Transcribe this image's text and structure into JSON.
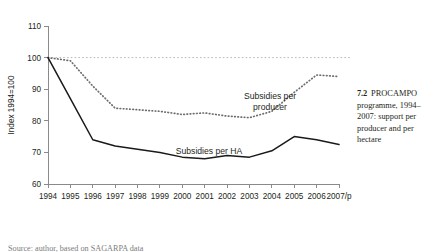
{
  "caption": {
    "number": "7.2",
    "text": "PROCAMPO programme, 1994–2007: support per producer and per hectare"
  },
  "footer": {
    "partial_text": "Source: author, based on SAGARPA data"
  },
  "chart_data": {
    "type": "line",
    "title": "",
    "subtitle": "",
    "xlabel": "",
    "ylabel": "Index 1994=100",
    "ylim": [
      60,
      110
    ],
    "yticks": [
      60,
      70,
      80,
      90,
      100,
      110
    ],
    "grid": false,
    "legend_position": "inline-annotation",
    "reference_line": {
      "value": 100,
      "style": "dotted",
      "color": "#b9b9b9"
    },
    "categories": [
      "1994",
      "1995",
      "1996",
      "1997",
      "1998",
      "1999",
      "2000",
      "2001",
      "2002",
      "2003",
      "2004",
      "2005",
      "2006",
      "2007/p"
    ],
    "series": [
      {
        "name": "Subsidies per producer",
        "style": "dotted",
        "color": "#6d6d6d",
        "values": [
          100,
          99,
          91,
          84,
          83.5,
          83,
          82,
          82.5,
          81.5,
          81,
          83,
          89,
          94.5,
          94
        ]
      },
      {
        "name": "Subsidies per HA",
        "style": "solid",
        "color": "#1a1a1a",
        "values": [
          100,
          87,
          74,
          72,
          71,
          70,
          68.5,
          68,
          69,
          68.5,
          70.5,
          75,
          74,
          72.5
        ]
      }
    ],
    "annotations": [
      {
        "text": "Subsidies per",
        "x_px": 270,
        "y_px": 99
      },
      {
        "text": "producer",
        "x_px": 270,
        "y_px": 110
      },
      {
        "text": "Subsidies per HA",
        "x_px": 209,
        "y_px": 154
      }
    ]
  }
}
